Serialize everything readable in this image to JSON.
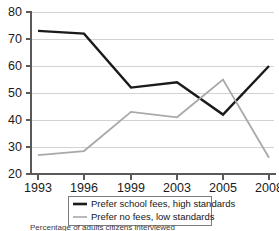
{
  "chart_data": {
    "type": "line",
    "title": "",
    "subtitle": "",
    "caption": "Percentage of adults citizens interviewed",
    "xlabel": "",
    "ylabel": "",
    "categories": [
      "1993",
      "1996",
      "1999",
      "2003",
      "2005",
      "2008"
    ],
    "xtick_labels": [
      "1993",
      "1996",
      "1999",
      "2003",
      "2005",
      "2008"
    ],
    "ytick_labels": [
      "20",
      "30",
      "40",
      "50",
      "60",
      "70",
      "80"
    ],
    "ylim": [
      20,
      80
    ],
    "ytick_step": 10,
    "grid": true,
    "grid_axis": "y",
    "legend_position": "bottom",
    "series": [
      {
        "name": "Prefer school fees, high standards",
        "color": "#1a1a1a",
        "width": 2.4,
        "values": [
          73,
          72,
          52,
          54,
          42,
          60
        ]
      },
      {
        "name": "Prefer no fees, low standards",
        "color": "#a9a9a9",
        "width": 1.8,
        "values": [
          27,
          28.5,
          43,
          41,
          55,
          26
        ]
      }
    ]
  },
  "legend": {
    "items": [
      {
        "label": "Prefer school fees, high standards",
        "color": "#1a1a1a",
        "width": 2.6
      },
      {
        "label": "Prefer no fees, low standards",
        "color": "#a9a9a9",
        "width": 1.6
      }
    ]
  },
  "axes": {
    "y_ticks": [
      "80",
      "70",
      "60",
      "50",
      "40",
      "30",
      "20"
    ],
    "x_ticks": [
      "1993",
      "1996",
      "1999",
      "2003",
      "2005",
      "2008"
    ]
  },
  "caption": {
    "text": "Percentage of adults citizens interviewed"
  }
}
